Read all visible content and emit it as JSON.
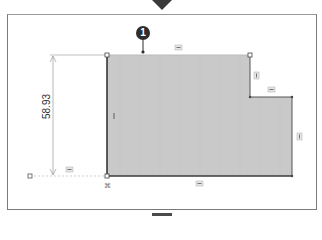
{
  "canvas": {
    "dimension_value": "58.93",
    "callout_number": "1"
  },
  "colors": {
    "shape_fill": "#c9c9c9",
    "shape_edge": "#3a3a3a",
    "frame_border": "#7a7a7a",
    "dimension_line": "#888888",
    "callout_bg": "#2d2d2d"
  },
  "relations": {
    "top_edge": "horizontal",
    "step_vertical": "vertical",
    "step_horizontal": "horizontal",
    "right_edge": "vertical",
    "bottom_edge": "horizontal",
    "left_edge": "vertical",
    "construction_line": "horizontal",
    "origin_point": "fixed"
  }
}
